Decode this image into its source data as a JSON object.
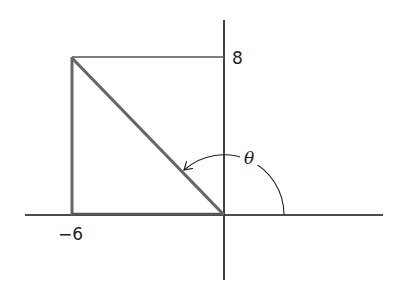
{
  "diagram": {
    "title": "",
    "point": {
      "x": -6,
      "y": 8
    },
    "labels": {
      "x_value": "−6",
      "y_value": "8",
      "angle": "θ"
    },
    "colors": {
      "axes": "#111111",
      "box": "#555555",
      "terminal_side": "#666666"
    }
  }
}
